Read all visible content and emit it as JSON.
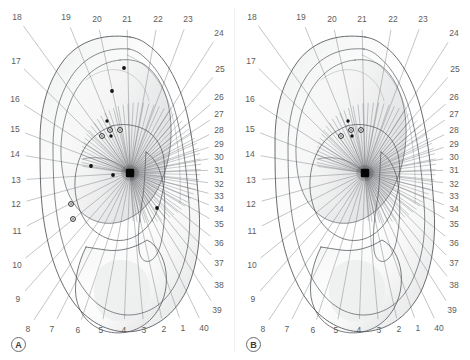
{
  "figure": {
    "width": 470,
    "height": 360,
    "background": "#ffffff",
    "line_color": "#6f7276",
    "label_color": "#5c5c5c",
    "marker_fill_color": "#111111",
    "marker_open_color": "#1a1a1a",
    "hub_color": "#000000",
    "divider_color": "#f2f2f2"
  },
  "panels": [
    {
      "id": "panel-a",
      "letter": "A",
      "letter_pos": {
        "x": 18,
        "y": 344
      },
      "hub": {
        "x": 130,
        "y": 173
      },
      "ticks": [
        {
          "label": "18",
          "x": 17,
          "y": 17
        },
        {
          "label": "19",
          "x": 66,
          "y": 17
        },
        {
          "label": "20",
          "x": 97,
          "y": 19
        },
        {
          "label": "21",
          "x": 127,
          "y": 19
        },
        {
          "label": "22",
          "x": 158,
          "y": 19
        },
        {
          "label": "23",
          "x": 188,
          "y": 19
        },
        {
          "label": "24",
          "x": 219,
          "y": 33
        },
        {
          "label": "17",
          "x": 16,
          "y": 61
        },
        {
          "label": "25",
          "x": 220,
          "y": 69
        },
        {
          "label": "16",
          "x": 15,
          "y": 99
        },
        {
          "label": "26",
          "x": 219,
          "y": 97
        },
        {
          "label": "27",
          "x": 219,
          "y": 114
        },
        {
          "label": "15",
          "x": 15,
          "y": 129
        },
        {
          "label": "28",
          "x": 219,
          "y": 130
        },
        {
          "label": "29",
          "x": 219,
          "y": 144
        },
        {
          "label": "14",
          "x": 15,
          "y": 154
        },
        {
          "label": "30",
          "x": 219,
          "y": 157
        },
        {
          "label": "31",
          "x": 219,
          "y": 170
        },
        {
          "label": "32",
          "x": 219,
          "y": 184
        },
        {
          "label": "13",
          "x": 16,
          "y": 180
        },
        {
          "label": "33",
          "x": 219,
          "y": 196
        },
        {
          "label": "34",
          "x": 219,
          "y": 209
        },
        {
          "label": "12",
          "x": 16,
          "y": 204
        },
        {
          "label": "35",
          "x": 219,
          "y": 224
        },
        {
          "label": "11",
          "x": 17,
          "y": 231
        },
        {
          "label": "36",
          "x": 219,
          "y": 243
        },
        {
          "label": "37",
          "x": 219,
          "y": 263
        },
        {
          "label": "10",
          "x": 17,
          "y": 265
        },
        {
          "label": "38",
          "x": 219,
          "y": 285
        },
        {
          "label": "9",
          "x": 18,
          "y": 299
        },
        {
          "label": "39",
          "x": 217,
          "y": 310
        },
        {
          "label": "8",
          "x": 28,
          "y": 329
        },
        {
          "label": "7",
          "x": 52,
          "y": 329
        },
        {
          "label": "6",
          "x": 78,
          "y": 330
        },
        {
          "label": "5",
          "x": 101,
          "y": 330
        },
        {
          "label": "4",
          "x": 124,
          "y": 330
        },
        {
          "label": "3",
          "x": 144,
          "y": 330
        },
        {
          "label": "2",
          "x": 164,
          "y": 329
        },
        {
          "label": "1",
          "x": 183,
          "y": 328
        },
        {
          "label": "40",
          "x": 204,
          "y": 328
        }
      ],
      "markers": [
        {
          "type": "filled",
          "x": 124,
          "y": 68,
          "r": 1.9
        },
        {
          "type": "filled",
          "x": 112,
          "y": 91,
          "r": 1.9
        },
        {
          "type": "filled",
          "x": 107,
          "y": 121,
          "r": 1.7
        },
        {
          "type": "open",
          "x": 110,
          "y": 130,
          "r": 2.4
        },
        {
          "type": "open",
          "x": 120,
          "y": 130,
          "r": 2.4
        },
        {
          "type": "open",
          "x": 102,
          "y": 136,
          "r": 2.4
        },
        {
          "type": "filled",
          "x": 111,
          "y": 136,
          "r": 1.7
        },
        {
          "type": "filled",
          "x": 91,
          "y": 166,
          "r": 1.9
        },
        {
          "type": "filled",
          "x": 113,
          "y": 175,
          "r": 1.9
        },
        {
          "type": "open",
          "x": 71,
          "y": 204,
          "r": 2.4
        },
        {
          "type": "open",
          "x": 73,
          "y": 219,
          "r": 2.4
        },
        {
          "type": "filled",
          "x": 157,
          "y": 208,
          "r": 1.9
        }
      ]
    },
    {
      "id": "panel-b",
      "letter": "B",
      "letter_pos": {
        "x": 18,
        "y": 344
      },
      "hub": {
        "x": 130,
        "y": 173
      },
      "ticks": [
        {
          "label": "18",
          "x": 17,
          "y": 17
        },
        {
          "label": "19",
          "x": 66,
          "y": 17
        },
        {
          "label": "20",
          "x": 97,
          "y": 19
        },
        {
          "label": "21",
          "x": 127,
          "y": 19
        },
        {
          "label": "22",
          "x": 158,
          "y": 19
        },
        {
          "label": "23",
          "x": 188,
          "y": 19
        },
        {
          "label": "24",
          "x": 219,
          "y": 33
        },
        {
          "label": "17",
          "x": 16,
          "y": 61
        },
        {
          "label": "25",
          "x": 220,
          "y": 69
        },
        {
          "label": "16",
          "x": 15,
          "y": 99
        },
        {
          "label": "26",
          "x": 219,
          "y": 97
        },
        {
          "label": "27",
          "x": 219,
          "y": 114
        },
        {
          "label": "15",
          "x": 15,
          "y": 129
        },
        {
          "label": "28",
          "x": 219,
          "y": 130
        },
        {
          "label": "29",
          "x": 219,
          "y": 144
        },
        {
          "label": "14",
          "x": 15,
          "y": 154
        },
        {
          "label": "30",
          "x": 219,
          "y": 157
        },
        {
          "label": "31",
          "x": 219,
          "y": 170
        },
        {
          "label": "32",
          "x": 219,
          "y": 184
        },
        {
          "label": "13",
          "x": 16,
          "y": 180
        },
        {
          "label": "33",
          "x": 219,
          "y": 196
        },
        {
          "label": "34",
          "x": 219,
          "y": 209
        },
        {
          "label": "12",
          "x": 16,
          "y": 204
        },
        {
          "label": "35",
          "x": 219,
          "y": 224
        },
        {
          "label": "11",
          "x": 17,
          "y": 231
        },
        {
          "label": "36",
          "x": 219,
          "y": 243
        },
        {
          "label": "37",
          "x": 219,
          "y": 263
        },
        {
          "label": "10",
          "x": 17,
          "y": 265
        },
        {
          "label": "38",
          "x": 219,
          "y": 285
        },
        {
          "label": "9",
          "x": 18,
          "y": 299
        },
        {
          "label": "39",
          "x": 217,
          "y": 310
        },
        {
          "label": "8",
          "x": 28,
          "y": 329
        },
        {
          "label": "7",
          "x": 52,
          "y": 329
        },
        {
          "label": "6",
          "x": 78,
          "y": 330
        },
        {
          "label": "5",
          "x": 101,
          "y": 330
        },
        {
          "label": "4",
          "x": 124,
          "y": 330
        },
        {
          "label": "3",
          "x": 144,
          "y": 330
        },
        {
          "label": "2",
          "x": 164,
          "y": 329
        },
        {
          "label": "1",
          "x": 183,
          "y": 328
        },
        {
          "label": "40",
          "x": 204,
          "y": 328
        }
      ],
      "markers": [
        {
          "type": "filled",
          "x": 113,
          "y": 121,
          "r": 1.7
        },
        {
          "type": "open",
          "x": 116,
          "y": 130,
          "r": 2.4
        },
        {
          "type": "open",
          "x": 126,
          "y": 130,
          "r": 2.4
        },
        {
          "type": "open",
          "x": 106,
          "y": 136,
          "r": 2.4
        },
        {
          "type": "filled",
          "x": 117,
          "y": 136,
          "r": 1.7
        }
      ]
    }
  ],
  "chart_data": {
    "type": "diagram",
    "panel_labels": [
      "A",
      "B"
    ],
    "sector_count": 40,
    "sector_numbers": [
      1,
      2,
      3,
      4,
      5,
      6,
      7,
      8,
      9,
      10,
      11,
      12,
      13,
      14,
      15,
      16,
      17,
      18,
      19,
      20,
      21,
      22,
      23,
      24,
      25,
      26,
      27,
      28,
      29,
      30,
      31,
      32,
      33,
      34,
      35,
      36,
      37,
      38,
      39,
      40
    ],
    "marker_legend": [
      {
        "type": "filled",
        "meaning": "filled point marker"
      },
      {
        "type": "open",
        "meaning": "open circle point marker"
      }
    ],
    "marker_counts": {
      "panel_a": 12,
      "panel_b": 5
    }
  }
}
